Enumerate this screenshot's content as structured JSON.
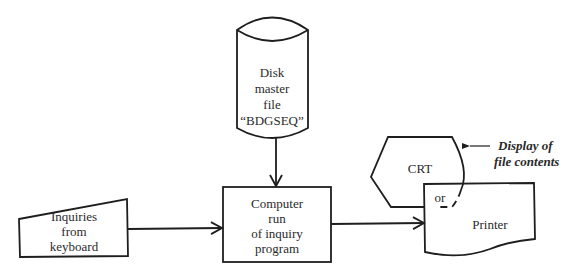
{
  "diagram": {
    "type": "flowchart",
    "nodes": {
      "disk": {
        "shape": "cylinder",
        "lines": [
          "Disk",
          "master",
          "file",
          "“BDGSEQ”"
        ]
      },
      "keyboard": {
        "shape": "manual-input",
        "lines": [
          "Inquiries",
          "from",
          "keyboard"
        ]
      },
      "computer": {
        "shape": "process",
        "lines": [
          "Computer",
          "run",
          "of inquiry",
          "program"
        ]
      },
      "crt": {
        "shape": "display",
        "lines": [
          "CRT"
        ]
      },
      "printer": {
        "shape": "document",
        "lines": [
          "Printer"
        ]
      },
      "or": {
        "lines": [
          "or"
        ]
      }
    },
    "annotation": {
      "lines": [
        "Display of",
        "file contents"
      ]
    },
    "edges": [
      {
        "from": "disk",
        "to": "computer"
      },
      {
        "from": "keyboard",
        "to": "computer"
      },
      {
        "from": "computer",
        "to": "printer"
      }
    ],
    "colors": {
      "stroke": "#1e1e1e",
      "text": "#2a2a2a",
      "background": "#ffffff"
    }
  }
}
